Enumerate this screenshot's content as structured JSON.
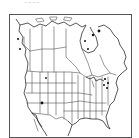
{
  "caption": {
    "text": "— — — —"
  },
  "map": {
    "region": "North America",
    "style": "black-and-white outline map with political boundaries",
    "colors": {
      "lines": "#444444",
      "coast": "#222222",
      "dots": "#111111",
      "background": "#ffffff"
    },
    "occurrence_dots": [
      {
        "label": "Hudson Bay east",
        "x": 98,
        "y": 30
      },
      {
        "label": "Quebec north",
        "x": 92,
        "y": 34
      },
      {
        "label": "Ontario",
        "x": 84,
        "y": 40
      },
      {
        "label": "Great Lakes",
        "x": 87,
        "y": 48
      },
      {
        "label": "Colorado",
        "x": 45,
        "y": 77
      },
      {
        "label": "New Mexico",
        "x": 41,
        "y": 102
      },
      {
        "label": "Northeast 1",
        "x": 104,
        "y": 78
      },
      {
        "label": "Northeast 2",
        "x": 107,
        "y": 82
      },
      {
        "label": "Northeast 3",
        "x": 103,
        "y": 84
      }
    ]
  }
}
